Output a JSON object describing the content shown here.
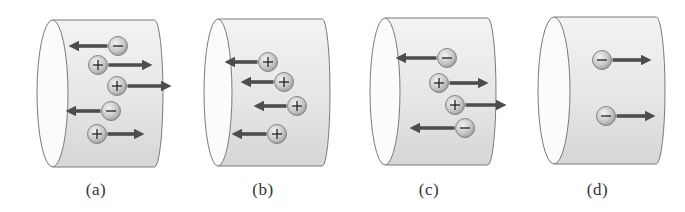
{
  "figure": {
    "colors": {
      "cylinder_fill": "#e4e4e4",
      "cylinder_fill_light": "#f2f2f2",
      "cylinder_stroke": "#7a7a7a",
      "end_cap_fill": "#fbfbfb",
      "arrow": "#4d4d4d",
      "charge_fill": "#c8c8c8",
      "charge_highlight": "#eeeeee",
      "charge_stroke": "#6e6e6e",
      "sign": "#222222"
    },
    "panels": [
      {
        "label": "(a)",
        "x": 37,
        "capLeft": 37,
        "capRight": 68,
        "right": 163,
        "top": 20,
        "bottom": 167,
        "charges": [
          {
            "sign": "-",
            "cx": 118,
            "cy": 46,
            "dir": "left",
            "len": 40
          },
          {
            "sign": "+",
            "cx": 98,
            "cy": 65,
            "dir": "right",
            "len": 45
          },
          {
            "sign": "+",
            "cx": 117,
            "cy": 86,
            "dir": "right",
            "len": 45
          },
          {
            "sign": "-",
            "cx": 111,
            "cy": 111,
            "dir": "left",
            "len": 36
          },
          {
            "sign": "+",
            "cx": 97,
            "cy": 134,
            "dir": "right",
            "len": 38
          }
        ]
      },
      {
        "label": "(b)",
        "x": 204,
        "capLeft": 204,
        "capRight": 232,
        "right": 330,
        "top": 19,
        "bottom": 166,
        "charges": [
          {
            "sign": "+",
            "cx": 268,
            "cy": 62,
            "dir": "left",
            "len": 34
          },
          {
            "sign": "+",
            "cx": 284,
            "cy": 82,
            "dir": "left",
            "len": 34
          },
          {
            "sign": "+",
            "cx": 297,
            "cy": 106,
            "dir": "left",
            "len": 34
          },
          {
            "sign": "+",
            "cx": 277,
            "cy": 134,
            "dir": "left",
            "len": 36
          }
        ]
      },
      {
        "label": "(c)",
        "x": 370,
        "capLeft": 370,
        "capRight": 400,
        "right": 496,
        "top": 18,
        "bottom": 165,
        "charges": [
          {
            "sign": "-",
            "cx": 447,
            "cy": 58,
            "dir": "left",
            "len": 42
          },
          {
            "sign": "+",
            "cx": 439,
            "cy": 83,
            "dir": "right",
            "len": 40
          },
          {
            "sign": "+",
            "cx": 455,
            "cy": 105,
            "dir": "right",
            "len": 42
          },
          {
            "sign": "-",
            "cx": 465,
            "cy": 128,
            "dir": "left",
            "len": 46
          }
        ]
      },
      {
        "label": "(d)",
        "x": 538,
        "capLeft": 538,
        "capRight": 570,
        "right": 665,
        "top": 17,
        "bottom": 164,
        "charges": [
          {
            "sign": "-",
            "cx": 602,
            "cy": 60,
            "dir": "right",
            "len": 40
          },
          {
            "sign": "-",
            "cx": 606,
            "cy": 116,
            "dir": "right",
            "len": 40
          }
        ]
      }
    ]
  }
}
